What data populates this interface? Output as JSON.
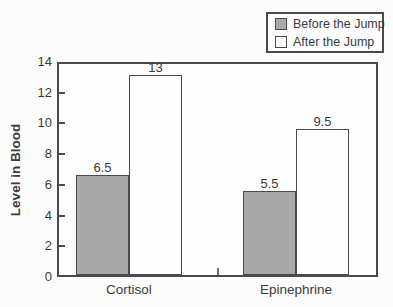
{
  "figure": {
    "background": "#fcfcfc"
  },
  "colors": {
    "bar_before_fill": "#a9a9a9",
    "bar_after_fill": "#fdfdfd",
    "bar_border": "#4a4a4a",
    "axis": "#4a4a4a",
    "text": "#3b3b3b"
  },
  "legend": {
    "position": "top-right",
    "items": [
      {
        "label": "Before the Jump",
        "swatch": "gray-filled-square",
        "fill": "#a9a9a9"
      },
      {
        "label": "After the Jump",
        "swatch": "white-square",
        "fill": "#fdfdfd"
      }
    ]
  },
  "chart_data": {
    "type": "bar",
    "title": "",
    "xlabel": "",
    "ylabel": "Level in Blood",
    "categories": [
      "Cortisol",
      "Epinephrine"
    ],
    "series": [
      {
        "name": "Before the Jump",
        "values": [
          6.5,
          5.5
        ],
        "labels": [
          "6.5",
          "5.5"
        ],
        "fill": "#a9a9a9"
      },
      {
        "name": "After the Jump",
        "values": [
          13,
          9.5
        ],
        "labels": [
          "13",
          "9.5"
        ],
        "fill": "#fdfdfd"
      }
    ],
    "ylim": [
      0,
      14
    ],
    "yticks": [
      0,
      2,
      4,
      6,
      8,
      10,
      12,
      14
    ],
    "grid": false,
    "legend_position": "top-right"
  }
}
